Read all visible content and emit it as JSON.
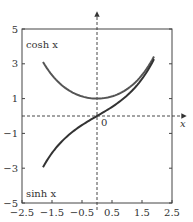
{
  "chart_data": {
    "type": "line",
    "title": "",
    "xlabel": "x",
    "ylabel": "",
    "xlim": [
      -2.5,
      2.5
    ],
    "ylim": [
      -5,
      5
    ],
    "grid": false,
    "x_ticks": [
      "-2.5",
      "-1.5",
      "-0.5",
      "0.5",
      "1.5",
      "2.5"
    ],
    "y_ticks": [
      "-5",
      "-3",
      "-1",
      "1",
      "3",
      "5"
    ],
    "origin_label": "0",
    "axis_arrow_label": "x",
    "series": [
      {
        "name": "cosh x",
        "label": "cosh x",
        "x": [
          -1.8,
          -1.5,
          -1.0,
          -0.5,
          0,
          0.5,
          1.0,
          1.5,
          1.9
        ],
        "values": [
          3.11,
          2.35,
          1.54,
          1.13,
          1.0,
          1.13,
          1.54,
          2.35,
          3.42
        ]
      },
      {
        "name": "sinh x",
        "label": "sinh x",
        "x": [
          -1.8,
          -1.5,
          -1.0,
          -0.5,
          0,
          0.5,
          1.0,
          1.5,
          1.9
        ],
        "values": [
          -2.94,
          -2.13,
          -1.18,
          -0.52,
          0,
          0.52,
          1.18,
          2.13,
          3.27
        ]
      }
    ],
    "legend": "inline labels (cosh x top-left, sinh x bottom-left)"
  }
}
